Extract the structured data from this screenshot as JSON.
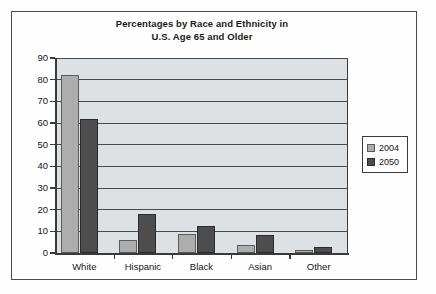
{
  "chart_data": {
    "type": "bar",
    "title": "Percentages by Race and Ethnicity in U.S. Age 65 and Older",
    "title_lines": [
      "Percentages by Race and Ethnicity in",
      "U.S. Age 65 and Older"
    ],
    "categories": [
      "White",
      "Hispanic",
      "Black",
      "Asian",
      "Other"
    ],
    "series": [
      {
        "name": "2004",
        "values": [
          82,
          6,
          9,
          3.5,
          1.5
        ],
        "color": "#adadad"
      },
      {
        "name": "2050",
        "values": [
          62,
          18,
          12.5,
          8.5,
          3
        ],
        "color": "#4d4d4d"
      }
    ],
    "xlabel": "",
    "ylabel": "",
    "ylim": [
      0,
      90
    ],
    "ytick_step": 10,
    "yticks": [
      0,
      10,
      20,
      30,
      40,
      50,
      60,
      70,
      80,
      90
    ],
    "ytick_labels": [
      "0",
      "10",
      "20",
      "30",
      "40",
      "50",
      "60",
      "70",
      "80",
      "90"
    ],
    "grid": true,
    "grid_axis": "y",
    "legend_position": "right",
    "plot_background": "#dde1e4",
    "frame_color": "#4b4b4b"
  },
  "legend": {
    "entries": [
      {
        "label": "2004"
      },
      {
        "label": "2050"
      }
    ]
  }
}
